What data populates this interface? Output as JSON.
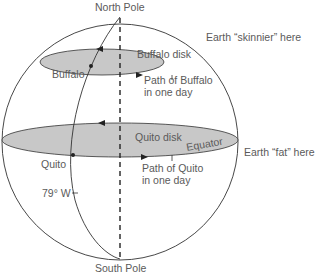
{
  "labels": {
    "north_pole": "North Pole",
    "south_pole": "South Pole",
    "earth_skinnier": "Earth “skinnier” here",
    "earth_fat": "Earth “fat” here",
    "buffalo_disk": "Buffalo disk",
    "buffalo": "Buffalo",
    "path_buffalo_1": "Path of Buffalo",
    "path_buffalo_2": "in one day",
    "quito_disk": "Quito disk",
    "equator": "Equator",
    "quito": "Quito",
    "path_quito_1": "Path of Quito",
    "path_quito_2": "in one day",
    "longitude": "79° W"
  },
  "colors": {
    "disk_fill": "#c8c8c8",
    "line": "#333333",
    "text": "#5a5a5a"
  }
}
